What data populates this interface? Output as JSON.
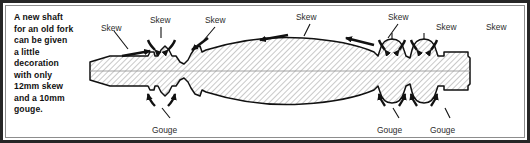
{
  "figure": {
    "kind": "woodturning-spindle-profile-diagram",
    "border_color": "#262626",
    "frame_color": "#8d8d8d",
    "background": "#ffffff",
    "ink_color": "#1a1a1a",
    "hatch_color": "#9a9a9a",
    "label_color": "#2b2b2b"
  },
  "caption": {
    "lines": [
      "A new shaft",
      "for an old fork",
      "can be given",
      "a little",
      "decoration",
      "with only",
      "12mm skew",
      "and a 10mm",
      "gouge."
    ]
  },
  "labels": {
    "skew": [
      {
        "text": "Skew",
        "x": 13,
        "y": 17
      },
      {
        "text": "Skew",
        "x": 62,
        "y": 9
      },
      {
        "text": "Skew",
        "x": 117,
        "y": 9
      },
      {
        "text": "Skew",
        "x": 208,
        "y": 6
      },
      {
        "text": "Skew",
        "x": 300,
        "y": 6
      },
      {
        "text": "Skew",
        "x": 348,
        "y": 16
      },
      {
        "text": "Skew",
        "x": 398,
        "y": 16
      }
    ],
    "gouge": [
      {
        "text": "Gouge",
        "x": 64,
        "y": 119
      },
      {
        "text": "Gouge",
        "x": 289,
        "y": 119
      },
      {
        "text": "Gouge",
        "x": 342,
        "y": 119
      }
    ]
  },
  "tools": {
    "skew_label": "Skew",
    "gouge_label": "Gouge"
  }
}
